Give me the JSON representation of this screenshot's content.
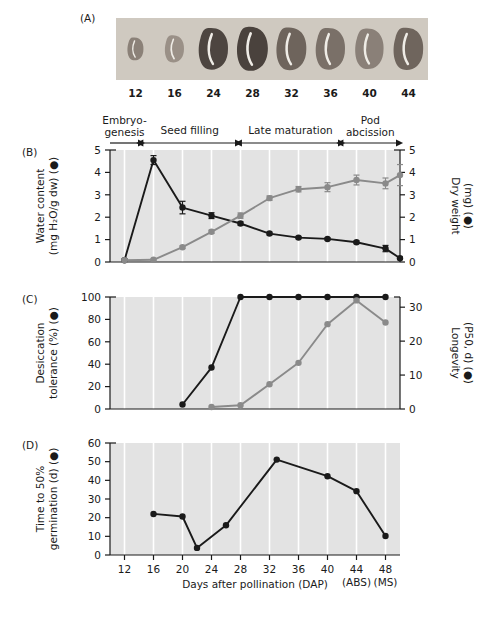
{
  "figure": {
    "panels": [
      "(A)",
      "(B)",
      "(C)",
      "(D)"
    ],
    "xlabel": "Days after pollination (DAP)",
    "x_ticks": [
      "12",
      "16",
      "20",
      "24",
      "28",
      "32",
      "36",
      "40",
      "44",
      "48"
    ],
    "x_tick_sub": {
      "44": "(ABS)",
      "48": "(MS)"
    },
    "xlim": [
      10,
      50
    ]
  },
  "panel_a": {
    "label": "(A)",
    "caption": "seed-photo-strip",
    "seed_labels": [
      "12",
      "16",
      "24",
      "28",
      "32",
      "36",
      "40",
      "44"
    ],
    "seed_sizes": [
      0.52,
      0.62,
      0.95,
      1.0,
      0.97,
      0.95,
      0.92,
      0.96
    ],
    "seed_shades": [
      "#8b8178",
      "#9a9087",
      "#4d4540",
      "#4a423d",
      "#6e645c",
      "#7a7068",
      "#8a8078",
      "#6f655d"
    ],
    "strip_bg": "#cfc9c0"
  },
  "stages": [
    {
      "name": "Embryo-\ngenesis",
      "line1": "Embryo-",
      "line2": "genesis",
      "start": 10,
      "end": 14,
      "arrow": "right"
    },
    {
      "name": "Seed filling",
      "line1": "Seed filling",
      "line2": "",
      "start": 14.6,
      "end": 27.4,
      "arrow": "both"
    },
    {
      "name": "Late maturation",
      "line1": "Late maturation",
      "line2": "",
      "start": 28.2,
      "end": 41.6,
      "arrow": "both"
    },
    {
      "name": "Pod abcission",
      "line1": "Pod",
      "line2": "abcission",
      "start": 42.2,
      "end": 49.6,
      "arrow": "both"
    }
  ],
  "chart_data": [
    {
      "panel": "(B)",
      "type": "line",
      "title": "",
      "xlabel": "Days after pollination (DAP)",
      "ylabel": "Water content\n(mg H₂O/g dw) (●)",
      "ylabel_line1": "Water content",
      "ylabel_line2": "(mg H₂O/g dw) (●)",
      "y2label_line1": "Dry weight",
      "y2label_line2": "(mg) (●)",
      "ylim": [
        0,
        5
      ],
      "y_ticks": [
        "0",
        "1",
        "2",
        "3",
        "4",
        "5"
      ],
      "y2lim": [
        0,
        5
      ],
      "y2_ticks": [
        "0",
        "1",
        "2",
        "3",
        "4",
        "5"
      ],
      "xlim": [
        10,
        50
      ],
      "grid": "vertical-white",
      "series": [
        {
          "name": "Water content",
          "color": "#1a1a1a",
          "axis": "left",
          "x": [
            12,
            16,
            20,
            24,
            28,
            32,
            36,
            40,
            44,
            48
          ],
          "values": [
            0.08,
            4.55,
            2.43,
            2.07,
            1.72,
            1.27,
            1.09,
            1.03,
            0.88,
            0.6
          ],
          "errors": [
            0.05,
            0.2,
            0.28,
            0.13,
            0.07,
            0.06,
            0.05,
            0.05,
            0.06,
            0.14
          ],
          "note": "first point at 12 DAP is near zero baseline; peak 4.55 at 16 DAP"
        },
        {
          "name": "Dry weight",
          "color": "#8a8a8a",
          "axis": "right",
          "x": [
            12,
            16,
            20,
            24,
            28,
            32,
            36,
            40,
            44,
            48
          ],
          "values": [
            0.08,
            0.1,
            0.66,
            1.35,
            2.07,
            2.85,
            3.25,
            3.34,
            3.66,
            3.51
          ],
          "errors": [
            0.04,
            0.04,
            0.06,
            0.07,
            0.12,
            0.1,
            0.12,
            0.2,
            0.22,
            0.24
          ]
        }
      ],
      "extra_points": [
        {
          "series": "Water content",
          "x": 50,
          "value": 0.17,
          "error": 0.05
        },
        {
          "series": "Dry weight",
          "x": 50,
          "value": 3.88,
          "error": 0.47
        }
      ]
    },
    {
      "panel": "(C)",
      "type": "line",
      "title": "",
      "xlabel": "Days after pollination (DAP)",
      "ylabel_line1": "Desiccation",
      "ylabel_line2": "tolerance (%) (●)",
      "y2label_line1": "Longevity",
      "y2label_line2": "(P50, d) (●)",
      "ylim": [
        0,
        100
      ],
      "y_ticks": [
        "0",
        "20",
        "40",
        "60",
        "80",
        "100"
      ],
      "y2lim": [
        0,
        33
      ],
      "y2_ticks": [
        "0",
        "10",
        "20",
        "30"
      ],
      "xlim": [
        10,
        50
      ],
      "grid": "vertical-white",
      "series": [
        {
          "name": "Desiccation tolerance",
          "color": "#1a1a1a",
          "axis": "left",
          "x": [
            20,
            24,
            28,
            32,
            36,
            40,
            44,
            48
          ],
          "values": [
            4,
            37,
            100,
            100,
            100,
            100,
            100,
            100
          ]
        },
        {
          "name": "Longevity",
          "color": "#8a8a8a",
          "axis": "right",
          "x": [
            24,
            28,
            32,
            36,
            40,
            44,
            48
          ],
          "values": [
            0.6,
            1.1,
            7.3,
            13.6,
            25.0,
            32.0,
            25.5
          ]
        }
      ]
    },
    {
      "panel": "(D)",
      "type": "line",
      "title": "",
      "xlabel": "Days after pollination (DAP)",
      "ylabel_line1": "Time to 50%",
      "ylabel_line2": "germination (d) (●)",
      "ylim": [
        0,
        60
      ],
      "y_ticks": [
        "0",
        "10",
        "20",
        "30",
        "40",
        "50",
        "60"
      ],
      "xlim": [
        10,
        50
      ],
      "grid": "vertical-white",
      "series": [
        {
          "name": "Time to 50% germination",
          "color": "#1a1a1a",
          "axis": "left",
          "x": [
            16,
            20,
            22,
            26,
            33,
            40,
            44,
            48
          ],
          "values": [
            22,
            20.6,
            3.8,
            15.9,
            51.1,
            42.2,
            34.2,
            10.2
          ]
        }
      ]
    }
  ],
  "colors": {
    "plot_bg": "#e3e3e3",
    "grid": "#ffffff",
    "dark_series": "#1a1a1a",
    "gray_series": "#8a8a8a",
    "axis": "#1a1a1a",
    "page_bg": "#ffffff"
  }
}
